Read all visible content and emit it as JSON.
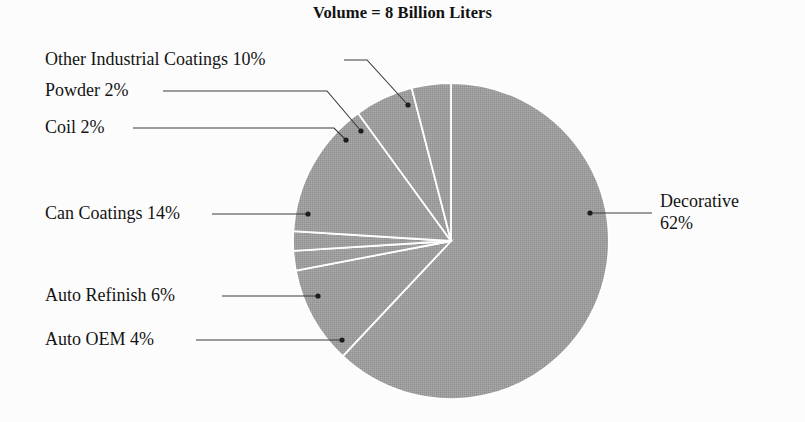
{
  "chart_data": {
    "type": "pie",
    "title": "Volume = 8 Billion Liters",
    "total_label": "8 Billion Liters",
    "unit": "%",
    "categories": [
      "Decorative",
      "Other Industrial Coatings",
      "Powder",
      "Coil",
      "Can Coatings",
      "Auto Refinish",
      "Auto OEM"
    ],
    "values": [
      62,
      10,
      2,
      2,
      14,
      6,
      4
    ],
    "labels": [
      "Decorative 62%",
      "Other Industrial Coatings 10%",
      "Powder 2%",
      "Coil 2%",
      "Can Coatings 14%",
      "Auto Refinish 6%",
      "Auto OEM 4%"
    ],
    "slice_color": "#9c9c9c",
    "divider_color": "#ffffff",
    "leader_color": "#3a3a3a",
    "background": "#fcfcfc",
    "start_angle_deg": 0,
    "direction": "clockwise",
    "legend": "none",
    "grid": false
  },
  "labels": {
    "decorative_line1": "Decorative",
    "decorative_line2": "62%",
    "other_industrial": "Other Industrial Coatings 10%",
    "powder": "Powder 2%",
    "coil": "Coil 2%",
    "can_coatings": "Can Coatings 14%",
    "auto_refinish": "Auto Refinish 6%",
    "auto_oem": "Auto OEM 4%"
  }
}
